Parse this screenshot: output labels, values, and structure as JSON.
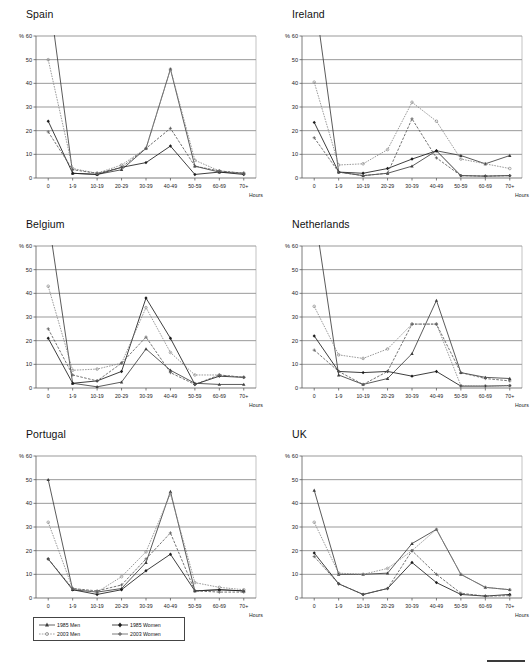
{
  "figure": {
    "axis_unit_label": "%",
    "x_axis_title": "Hours",
    "background": "#ffffff",
    "footer_rule": true
  },
  "legend": {
    "name": "series-legend",
    "entries": [
      {
        "label": "1985 Men",
        "color": "#3d3d3d",
        "marker": "triangle",
        "dash": "none"
      },
      {
        "label": "1985 Women",
        "color": "#1c1c1c",
        "marker": "diamond",
        "dash": "none"
      },
      {
        "label": "2003 Men",
        "color": "#8a8a8a",
        "marker": "circle",
        "dash": "dot"
      },
      {
        "label": "2003 Women",
        "color": "#5a5a5a",
        "marker": "cross",
        "dash": "dash"
      }
    ]
  },
  "chart_data": [
    {
      "type": "line",
      "title": "Spain",
      "xlabel": "Hours",
      "ylabel": "%",
      "categories": [
        "0",
        "1-9",
        "10-19",
        "20-29",
        "30-39",
        "40-49",
        "50-59",
        "60-69",
        "70+"
      ],
      "ylim": [
        0,
        60
      ],
      "yticks": [
        0,
        10,
        20,
        30,
        40,
        50,
        60
      ],
      "grid": true,
      "legend_position": "below-figure",
      "series": [
        {
          "name": "1985 Men",
          "values": [
            80.0,
            2.0,
            1.5,
            3.5,
            12.5,
            46.0,
            5.0,
            2.5,
            2.0
          ]
        },
        {
          "name": "1985 Women",
          "values": [
            24.0,
            2.0,
            1.5,
            4.5,
            6.5,
            13.5,
            1.5,
            2.5,
            1.5
          ]
        },
        {
          "name": "2003 Men",
          "values": [
            50.0,
            4.0,
            2.0,
            5.5,
            12.5,
            46.0,
            7.5,
            3.0,
            2.0
          ]
        },
        {
          "name": "2003 Women",
          "values": [
            19.5,
            3.5,
            2.0,
            4.5,
            12.5,
            21.0,
            5.0,
            3.0,
            2.0
          ]
        }
      ]
    },
    {
      "type": "line",
      "title": "Ireland",
      "xlabel": "Hours",
      "ylabel": "%",
      "categories": [
        "0",
        "1-9",
        "10-19",
        "20-29",
        "30-39",
        "40-49",
        "50-59",
        "60-69",
        "70+"
      ],
      "ylim": [
        0,
        60
      ],
      "yticks": [
        0,
        10,
        20,
        30,
        40,
        50,
        60
      ],
      "grid": true,
      "legend_position": "below-figure",
      "series": [
        {
          "name": "1985 Men",
          "values": [
            78.0,
            2.5,
            1.0,
            2.0,
            5.0,
            11.5,
            9.5,
            6.0,
            9.5
          ]
        },
        {
          "name": "1985 Women",
          "values": [
            23.5,
            2.5,
            2.0,
            4.0,
            8.0,
            11.5,
            1.0,
            0.8,
            1.0
          ]
        },
        {
          "name": "2003 Men",
          "values": [
            40.5,
            5.5,
            6.0,
            12.0,
            32.0,
            24.0,
            8.0,
            6.0,
            4.0
          ]
        },
        {
          "name": "2003 Women",
          "values": [
            17.0,
            2.5,
            1.0,
            2.0,
            25.0,
            8.5,
            1.0,
            0.8,
            1.0
          ]
        }
      ]
    },
    {
      "type": "line",
      "title": "Belgium",
      "xlabel": "Hours",
      "ylabel": "%",
      "categories": [
        "0",
        "1-9",
        "10-19",
        "20-29",
        "30-39",
        "40-49",
        "50-59",
        "60-69",
        "70+"
      ],
      "ylim": [
        0,
        60
      ],
      "yticks": [
        0,
        10,
        20,
        30,
        40,
        50,
        60
      ],
      "grid": true,
      "legend_position": "below-figure",
      "series": [
        {
          "name": "1985 Men",
          "values": [
            72.0,
            2.0,
            0.5,
            2.5,
            16.5,
            7.5,
            2.0,
            1.5,
            1.5
          ]
        },
        {
          "name": "1985 Women",
          "values": [
            21.0,
            2.0,
            3.0,
            7.0,
            38.0,
            21.0,
            1.5,
            5.0,
            4.5
          ]
        },
        {
          "name": "2003 Men",
          "values": [
            43.0,
            7.5,
            8.0,
            10.5,
            34.0,
            15.0,
            5.5,
            5.5,
            4.5
          ]
        },
        {
          "name": "2003 Women",
          "values": [
            25.0,
            5.5,
            3.0,
            10.5,
            21.5,
            6.5,
            1.5,
            5.5,
            4.5
          ]
        }
      ]
    },
    {
      "type": "line",
      "title": "Netherlands",
      "xlabel": "Hours",
      "ylabel": "%",
      "categories": [
        "0",
        "1-9",
        "10-19",
        "20-29",
        "30-39",
        "40-49",
        "50-59",
        "60-69",
        "70+"
      ],
      "ylim": [
        0,
        60
      ],
      "yticks": [
        0,
        10,
        20,
        30,
        40,
        50,
        60
      ],
      "grid": true,
      "legend_position": "below-figure",
      "series": [
        {
          "name": "1985 Men",
          "values": [
            75.0,
            5.5,
            1.5,
            4.0,
            14.5,
            37.0,
            6.5,
            4.5,
            4.0
          ]
        },
        {
          "name": "1985 Women",
          "values": [
            22.0,
            7.0,
            6.5,
            7.0,
            5.0,
            7.0,
            0.8,
            0.8,
            1.0
          ]
        },
        {
          "name": "2003 Men",
          "values": [
            34.5,
            14.0,
            12.5,
            16.5,
            27.0,
            27.0,
            1.0,
            0.8,
            1.0
          ]
        },
        {
          "name": "2003 Women",
          "values": [
            16.0,
            7.0,
            1.5,
            7.0,
            27.0,
            27.0,
            6.5,
            4.0,
            3.0
          ]
        }
      ]
    },
    {
      "type": "line",
      "title": "Portugal",
      "xlabel": "Hours",
      "ylabel": "%",
      "categories": [
        "0",
        "1-9",
        "10-19",
        "20-29",
        "30-39",
        "40-49",
        "50-59",
        "60-69",
        "70+"
      ],
      "ylim": [
        0,
        60
      ],
      "yticks": [
        0,
        10,
        20,
        30,
        40,
        50,
        60
      ],
      "grid": true,
      "legend_position": "below-figure",
      "series": [
        {
          "name": "1985 Men",
          "values": [
            50.0,
            3.5,
            2.5,
            4.0,
            15.0,
            45.0,
            3.0,
            3.5,
            3.0
          ]
        },
        {
          "name": "1985 Women",
          "values": [
            16.5,
            3.5,
            1.5,
            3.5,
            11.5,
            18.5,
            3.0,
            3.5,
            3.0
          ]
        },
        {
          "name": "2003 Men",
          "values": [
            32.0,
            4.0,
            2.5,
            9.0,
            19.5,
            44.0,
            6.5,
            4.5,
            3.5
          ]
        },
        {
          "name": "2003 Women",
          "values": [
            16.5,
            4.0,
            3.0,
            5.5,
            16.5,
            27.5,
            3.0,
            2.5,
            2.5
          ]
        }
      ]
    },
    {
      "type": "line",
      "title": "UK",
      "xlabel": "Hours",
      "ylabel": "%",
      "categories": [
        "0",
        "1-9",
        "10-19",
        "20-29",
        "30-39",
        "40-49",
        "50-59",
        "60-69",
        "70+"
      ],
      "ylim": [
        0,
        60
      ],
      "yticks": [
        0,
        10,
        20,
        30,
        40,
        50,
        60
      ],
      "grid": true,
      "legend_position": "below-figure",
      "series": [
        {
          "name": "1985 Men",
          "values": [
            45.5,
            10.0,
            10.0,
            10.5,
            23.0,
            29.0,
            10.0,
            4.5,
            3.5
          ]
        },
        {
          "name": "1985 Women",
          "values": [
            19.0,
            6.0,
            1.5,
            4.0,
            15.0,
            6.5,
            1.5,
            0.8,
            1.5
          ]
        },
        {
          "name": "2003 Men",
          "values": [
            32.0,
            10.5,
            10.0,
            12.5,
            20.0,
            29.0,
            10.0,
            4.5,
            3.5
          ]
        },
        {
          "name": "2003 Women",
          "values": [
            17.5,
            6.0,
            1.5,
            4.0,
            20.0,
            10.0,
            2.0,
            0.8,
            1.0
          ]
        }
      ]
    }
  ]
}
